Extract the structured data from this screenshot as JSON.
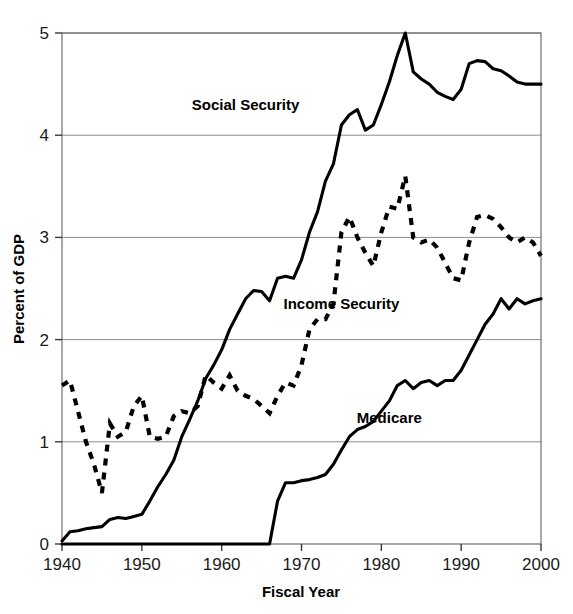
{
  "chart_data": {
    "type": "line",
    "title": "",
    "xlabel": "Fiscal Year",
    "ylabel": "Percent of GDP",
    "xlim": [
      1940,
      2000
    ],
    "ylim": [
      0,
      5
    ],
    "xticks": [
      1940,
      1950,
      1960,
      1970,
      1980,
      1990,
      2000
    ],
    "xtick_labels": [
      "1940",
      "1950",
      "1960",
      "1970",
      "1980",
      "1990",
      "2000"
    ],
    "yticks": [
      0,
      1,
      2,
      3,
      4,
      5
    ],
    "ytick_labels": [
      "0",
      "1",
      "2",
      "3",
      "4",
      "5"
    ],
    "grid": "horizontal",
    "legend_position": "inline-annotations",
    "x": [
      1940,
      1941,
      1942,
      1943,
      1944,
      1945,
      1946,
      1947,
      1948,
      1949,
      1950,
      1951,
      1952,
      1953,
      1954,
      1955,
      1956,
      1957,
      1958,
      1959,
      1960,
      1961,
      1962,
      1963,
      1964,
      1965,
      1966,
      1967,
      1968,
      1969,
      1970,
      1971,
      1972,
      1973,
      1974,
      1975,
      1976,
      1977,
      1978,
      1979,
      1980,
      1981,
      1982,
      1983,
      1984,
      1985,
      1986,
      1987,
      1988,
      1989,
      1990,
      1991,
      1992,
      1993,
      1994,
      1995,
      1996,
      1997,
      1998,
      1999,
      2000
    ],
    "series": [
      {
        "name": "Social Security",
        "style": "solid",
        "color": "#000000",
        "label_x": 1963,
        "label_y": 4.25,
        "values": [
          0.03,
          0.12,
          0.13,
          0.15,
          0.16,
          0.17,
          0.24,
          0.26,
          0.25,
          0.27,
          0.29,
          0.42,
          0.56,
          0.68,
          0.82,
          1.05,
          1.22,
          1.4,
          1.62,
          1.75,
          1.9,
          2.1,
          2.25,
          2.4,
          2.48,
          2.47,
          2.38,
          2.6,
          2.62,
          2.6,
          2.78,
          3.05,
          3.25,
          3.55,
          3.72,
          4.1,
          4.2,
          4.25,
          4.05,
          4.1,
          4.3,
          4.52,
          4.78,
          5.0,
          4.62,
          4.55,
          4.5,
          4.42,
          4.38,
          4.35,
          4.45,
          4.7,
          4.73,
          4.72,
          4.65,
          4.63,
          4.58,
          4.52,
          4.5,
          4.5,
          4.5
        ]
      },
      {
        "name": "Income Security",
        "style": "dashed",
        "color": "#000000",
        "label_x": 1975,
        "label_y": 2.3,
        "values": [
          1.55,
          1.6,
          1.3,
          1.0,
          0.78,
          0.5,
          1.18,
          1.05,
          1.1,
          1.35,
          1.45,
          1.05,
          1.03,
          1.05,
          1.25,
          1.3,
          1.28,
          1.35,
          1.65,
          1.58,
          1.52,
          1.65,
          1.5,
          1.45,
          1.42,
          1.35,
          1.28,
          1.45,
          1.58,
          1.55,
          1.75,
          2.1,
          2.2,
          2.2,
          2.35,
          3.05,
          3.2,
          3.0,
          2.85,
          2.72,
          3.05,
          3.3,
          3.28,
          3.6,
          3.0,
          2.95,
          2.98,
          2.9,
          2.75,
          2.6,
          2.58,
          2.95,
          3.2,
          3.22,
          3.18,
          3.1,
          3.0,
          2.95,
          3.0,
          2.95,
          2.82
        ]
      },
      {
        "name": "Medicare",
        "style": "solid-thick",
        "color": "#000000",
        "label_x": 1981,
        "label_y": 1.18,
        "values": [
          0,
          0,
          0,
          0,
          0,
          0,
          0,
          0,
          0,
          0,
          0,
          0,
          0,
          0,
          0,
          0,
          0,
          0,
          0,
          0,
          0,
          0,
          0,
          0,
          0,
          0,
          0.0,
          0.42,
          0.6,
          0.6,
          0.62,
          0.63,
          0.65,
          0.68,
          0.78,
          0.92,
          1.05,
          1.12,
          1.15,
          1.2,
          1.3,
          1.4,
          1.55,
          1.6,
          1.52,
          1.58,
          1.6,
          1.55,
          1.6,
          1.6,
          1.7,
          1.85,
          2.0,
          2.15,
          2.25,
          2.4,
          2.3,
          2.4,
          2.35,
          2.38,
          2.4
        ]
      }
    ]
  }
}
